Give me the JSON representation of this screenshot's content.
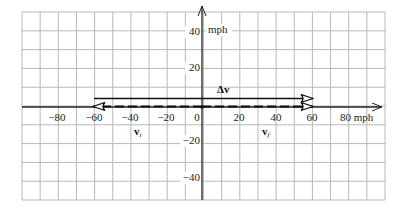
{
  "diagram": {
    "units": "mph",
    "grid": {
      "x_min": -100,
      "x_max": 100,
      "y_min": -50,
      "y_max": 50,
      "step": 10,
      "line_color": "#b8b8b8",
      "axis_color": "#222222"
    },
    "x_axis": {
      "end_label": "80 mph",
      "tick_labels": [
        "−80",
        "−60",
        "−40",
        "−20",
        "0",
        "20",
        "40",
        "60"
      ]
    },
    "y_axis": {
      "unit_label": "mph",
      "tick_labels": [
        "40",
        "20",
        "−20",
        "−40"
      ]
    },
    "vectors": [
      {
        "name": "v_i",
        "label": "v",
        "subscript": "i",
        "from": 0,
        "to": -60,
        "style": "dashed"
      },
      {
        "name": "v_f",
        "label": "v",
        "subscript": "f",
        "from": 0,
        "to": 60,
        "style": "dashed"
      },
      {
        "name": "delta_v",
        "label": "Δv",
        "from": -60,
        "to": 60,
        "style": "solid"
      }
    ]
  }
}
